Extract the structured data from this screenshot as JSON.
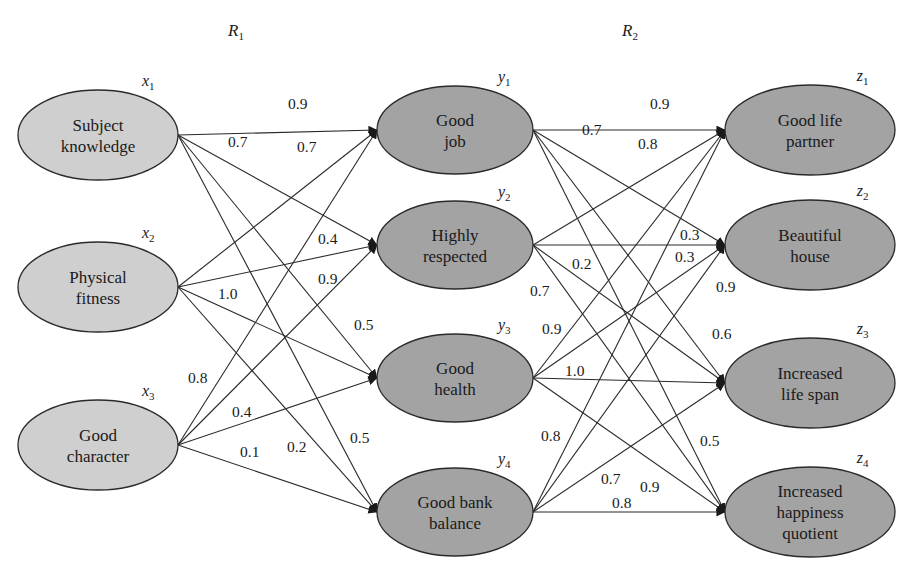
{
  "relations": [
    {
      "symbol": "R",
      "sub": "1",
      "x": 228,
      "y": 36
    },
    {
      "symbol": "R",
      "sub": "2",
      "x": 622,
      "y": 36
    }
  ],
  "colors": {
    "input_fill": "#cfcfcf",
    "output_fill": "#a3a3a3",
    "stroke": "#2a2a2a"
  },
  "layers": {
    "x": [
      {
        "id": "x1",
        "var": "x",
        "sub": "1",
        "lines": [
          "Subject",
          "knowledge"
        ],
        "cx": 98,
        "cy": 135,
        "rx": 80,
        "ry": 45
      },
      {
        "id": "x2",
        "var": "x",
        "sub": "2",
        "lines": [
          "Physical",
          "fitness"
        ],
        "cx": 98,
        "cy": 287,
        "rx": 80,
        "ry": 45
      },
      {
        "id": "x3",
        "var": "x",
        "sub": "3",
        "lines": [
          "Good",
          "character"
        ],
        "cx": 98,
        "cy": 445,
        "rx": 80,
        "ry": 45
      }
    ],
    "y": [
      {
        "id": "y1",
        "var": "y",
        "sub": "1",
        "lines": [
          "Good",
          "job"
        ],
        "cx": 455,
        "cy": 130,
        "rx": 78,
        "ry": 44
      },
      {
        "id": "y2",
        "var": "y",
        "sub": "2",
        "lines": [
          "Highly",
          "respected"
        ],
        "cx": 455,
        "cy": 245,
        "rx": 78,
        "ry": 44
      },
      {
        "id": "y3",
        "var": "y",
        "sub": "3",
        "lines": [
          "Good",
          "health"
        ],
        "cx": 455,
        "cy": 378,
        "rx": 78,
        "ry": 44
      },
      {
        "id": "y4",
        "var": "y",
        "sub": "4",
        "lines": [
          "Good bank",
          "balance"
        ],
        "cx": 455,
        "cy": 512,
        "rx": 78,
        "ry": 44
      }
    ],
    "z": [
      {
        "id": "z1",
        "var": "z",
        "sub": "1",
        "lines": [
          "Good life",
          "partner"
        ],
        "cx": 810,
        "cy": 130,
        "rx": 85,
        "ry": 45
      },
      {
        "id": "z2",
        "var": "z",
        "sub": "2",
        "lines": [
          "Beautiful",
          "house"
        ],
        "cx": 810,
        "cy": 245,
        "rx": 85,
        "ry": 45
      },
      {
        "id": "z3",
        "var": "z",
        "sub": "3",
        "lines": [
          "Increased",
          "life span"
        ],
        "cx": 810,
        "cy": 383,
        "rx": 85,
        "ry": 45
      },
      {
        "id": "z4",
        "var": "z",
        "sub": "4",
        "lines": [
          "Increased",
          "happiness",
          "quotient"
        ],
        "cx": 810,
        "cy": 512,
        "rx": 85,
        "ry": 45
      }
    ]
  },
  "edges_R1": [
    {
      "from": "x1",
      "to": "y1",
      "weight": "0.9",
      "lx": 288,
      "ly": 109
    },
    {
      "from": "x1",
      "to": "y2",
      "weight": "0.7",
      "lx": 228,
      "ly": 147
    },
    {
      "from": "x1",
      "to": "y3",
      "weight": "",
      "lx": 0,
      "ly": 0
    },
    {
      "from": "x1",
      "to": "y4",
      "weight": "",
      "lx": 0,
      "ly": 0
    },
    {
      "from": "x2",
      "to": "y1",
      "weight": "0.7",
      "lx": 297,
      "ly": 152
    },
    {
      "from": "x2",
      "to": "y2",
      "weight": "0.4",
      "lx": 318,
      "ly": 244
    },
    {
      "from": "x2",
      "to": "y3",
      "weight": "1.0",
      "lx": 218,
      "ly": 299
    },
    {
      "from": "x2",
      "to": "y4",
      "weight": "0.5",
      "lx": 354,
      "ly": 330
    },
    {
      "from": "x3",
      "to": "y1",
      "weight": "0.8",
      "lx": 188,
      "ly": 383
    },
    {
      "from": "x3",
      "to": "y2",
      "weight": "0.9",
      "lx": 318,
      "ly": 284
    },
    {
      "from": "x3",
      "to": "y3",
      "weight": "0.4",
      "lx": 232,
      "ly": 417
    },
    {
      "from": "x3",
      "to": "y4",
      "weight": "0.1",
      "lx": 240,
      "ly": 457
    }
  ],
  "edges_R1_extra_labels": [
    {
      "weight": "0.2",
      "lx": 287,
      "ly": 452
    },
    {
      "weight": "0.5",
      "lx": 350,
      "ly": 443
    }
  ],
  "edges_R2": [
    {
      "from": "y1",
      "to": "z1",
      "weight": "0.9",
      "lx": 650,
      "ly": 109
    },
    {
      "from": "y1",
      "to": "z2",
      "weight": "0.7",
      "lx": 582,
      "ly": 135
    },
    {
      "from": "y1",
      "to": "z3",
      "weight": "",
      "lx": 0,
      "ly": 0
    },
    {
      "from": "y1",
      "to": "z4",
      "weight": "",
      "lx": 0,
      "ly": 0
    },
    {
      "from": "y2",
      "to": "z1",
      "weight": "0.8",
      "lx": 638,
      "ly": 149
    },
    {
      "from": "y2",
      "to": "z2",
      "weight": "0.3",
      "lx": 680,
      "ly": 240
    },
    {
      "from": "y2",
      "to": "z3",
      "weight": "0.2",
      "lx": 572,
      "ly": 269
    },
    {
      "from": "y2",
      "to": "z4",
      "weight": "0.7",
      "lx": 530,
      "ly": 296
    },
    {
      "from": "y3",
      "to": "z1",
      "weight": "0.9",
      "lx": 542,
      "ly": 334
    },
    {
      "from": "y3",
      "to": "z2",
      "weight": "0.3",
      "lx": 675,
      "ly": 262
    },
    {
      "from": "y3",
      "to": "z3",
      "weight": "1.0",
      "lx": 565,
      "ly": 376
    },
    {
      "from": "y3",
      "to": "z4",
      "weight": "0.5",
      "lx": 700,
      "ly": 446
    },
    {
      "from": "y4",
      "to": "z1",
      "weight": "0.8",
      "lx": 541,
      "ly": 441
    },
    {
      "from": "y4",
      "to": "z2",
      "weight": "0.9",
      "lx": 716,
      "ly": 292
    },
    {
      "from": "y4",
      "to": "z3",
      "weight": "0.7",
      "lx": 601,
      "ly": 484
    },
    {
      "from": "y4",
      "to": "z4",
      "weight": "0.8",
      "lx": 612,
      "ly": 508
    }
  ],
  "edges_R2_extra_labels": [
    {
      "weight": "0.6",
      "lx": 712,
      "ly": 339
    },
    {
      "weight": "0.9",
      "lx": 640,
      "ly": 492
    }
  ]
}
